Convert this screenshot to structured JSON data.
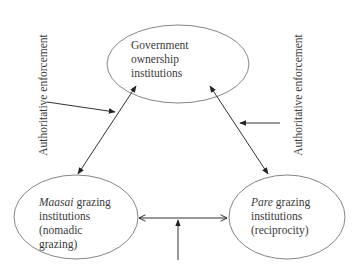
{
  "diagram": {
    "nodes": {
      "government": {
        "lines": [
          "Government",
          "ownership",
          "institutions"
        ]
      },
      "maasai": {
        "italic": "Maasai",
        "line1_rest": " grazing",
        "lines": [
          "institutions",
          "(nomadic",
          "grazing)"
        ]
      },
      "pare": {
        "italic": "Pare",
        "line1_rest": " grazing",
        "lines": [
          "institutions",
          "(reciprocity)"
        ]
      }
    },
    "labels": {
      "left": "Authoritative enforcement",
      "right": "Authoritative enforcement"
    },
    "colors": {
      "stroke": "#333333",
      "ellipse_stroke": "#777777"
    }
  }
}
